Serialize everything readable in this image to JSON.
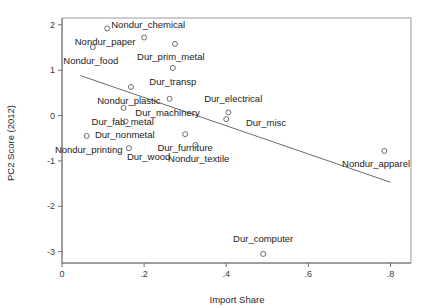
{
  "chart_data": {
    "type": "scatter",
    "title": "",
    "xlabel": "Import Share",
    "ylabel": "PC2 Score (2012)",
    "xlim": [
      0,
      0.85
    ],
    "ylim": [
      -3.25,
      2.15
    ],
    "xticks": [
      "0",
      ".2",
      ".4",
      ".6",
      ".8"
    ],
    "xtick_values": [
      0,
      0.2,
      0.4,
      0.6,
      0.8
    ],
    "yticks": [
      "2",
      "1",
      "0",
      "-1",
      "-2",
      "-3"
    ],
    "ytick_values": [
      2,
      1,
      0,
      -1,
      -2,
      -3
    ],
    "grid": false,
    "legend": "none",
    "marker_style": "open-circle",
    "points": [
      {
        "label": "Nondur_paper",
        "x": 0.11,
        "y": 1.92,
        "lx": -0.005,
        "ly": -0.3,
        "anchor": "middle"
      },
      {
        "label": "Nondur_food",
        "x": 0.075,
        "y": 1.51,
        "lx": -0.005,
        "ly": -0.3,
        "anchor": "middle"
      },
      {
        "label": "Nondur_chemical",
        "x": 0.2,
        "y": 1.72,
        "lx": 0.01,
        "ly": 0.28,
        "anchor": "middle"
      },
      {
        "label": "Dur_prim_metal",
        "x": 0.275,
        "y": 1.58,
        "lx": -0.01,
        "ly": -0.28,
        "anchor": "middle"
      },
      {
        "label": "Dur_transp",
        "x": 0.27,
        "y": 1.05,
        "lx": 0.0,
        "ly": -0.3,
        "anchor": "middle"
      },
      {
        "label": "Nondur_plastic",
        "x": 0.168,
        "y": 0.63,
        "lx": -0.005,
        "ly": -0.3,
        "anchor": "middle"
      },
      {
        "label": "Dur_machinery",
        "x": 0.262,
        "y": 0.37,
        "lx": -0.005,
        "ly": -0.3,
        "anchor": "middle"
      },
      {
        "label": "Dur_fab_metal",
        "x": 0.15,
        "y": 0.17,
        "lx": -0.002,
        "ly": -0.3,
        "anchor": "middle"
      },
      {
        "label": "Dur_electrical",
        "x": 0.405,
        "y": 0.07,
        "lx": 0.012,
        "ly": 0.3,
        "anchor": "middle"
      },
      {
        "label": "Dur_misc",
        "x": 0.4,
        "y": -0.08,
        "lx": 0.048,
        "ly": -0.07,
        "anchor": "start"
      },
      {
        "label": "Dur_nonmetal",
        "x": 0.155,
        "y": -0.13,
        "lx": -0.002,
        "ly": -0.3,
        "anchor": "middle"
      },
      {
        "label": "Nondur_printing",
        "x": 0.06,
        "y": -0.45,
        "lx": 0.005,
        "ly": -0.3,
        "anchor": "middle"
      },
      {
        "label": "Dur_furniture",
        "x": 0.3,
        "y": -0.41,
        "lx": 0.0,
        "ly": -0.3,
        "anchor": "middle"
      },
      {
        "label": "Dur_wood",
        "x": 0.163,
        "y": -0.72,
        "lx": 0.048,
        "ly": -0.18,
        "anchor": "middle"
      },
      {
        "label": "Nondur_textile",
        "x": 0.325,
        "y": -0.65,
        "lx": 0.008,
        "ly": -0.3,
        "anchor": "middle"
      },
      {
        "label": "Nondur_apparel",
        "x": 0.785,
        "y": -0.78,
        "lx": -0.02,
        "ly": -0.28,
        "anchor": "middle"
      },
      {
        "label": "Dur_computer",
        "x": 0.49,
        "y": -3.05,
        "lx": 0.0,
        "ly": 0.33,
        "anchor": "middle"
      }
    ],
    "fit_line": {
      "x0": 0.045,
      "y0": 0.88,
      "x1": 0.8,
      "y1": -1.47
    }
  },
  "colors": {
    "background": "#ffffff",
    "axis": "#6e6e6e",
    "marker": "#5c5c5c",
    "text": "#222222",
    "fit_line": "#5c5c5c"
  }
}
